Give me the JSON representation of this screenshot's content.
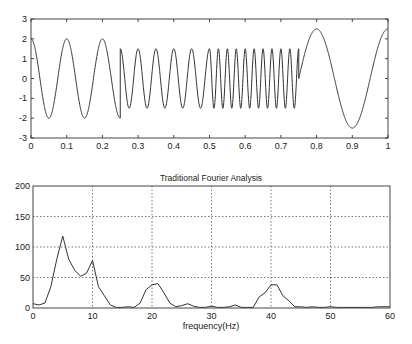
{
  "chart_data": [
    {
      "type": "line",
      "title": "",
      "xlabel": "",
      "ylabel": "",
      "xlim": [
        0,
        1
      ],
      "ylim": [
        -3,
        3
      ],
      "grid": false,
      "x_ticks": [
        "0",
        "0.1",
        "0.2",
        "0.3",
        "0.4",
        "0.5",
        "0.6",
        "0.7",
        "0.8",
        "0.9",
        "1"
      ],
      "y_ticks": [
        "3",
        "2",
        "1",
        "0",
        "-1",
        "-2",
        "-3"
      ],
      "segments": [
        {
          "t_start": 0.0,
          "t_end": 0.25,
          "frequency_hz": 10,
          "amplitude": 2.0,
          "form": "cos"
        },
        {
          "t_start": 0.25,
          "t_end": 0.5,
          "frequency_hz": 20,
          "amplitude": 1.5,
          "form": "cos"
        },
        {
          "t_start": 0.5,
          "t_end": 0.75,
          "frequency_hz": 40,
          "amplitude": 1.5,
          "form": "cos"
        },
        {
          "t_start": 0.75,
          "t_end": 1.0,
          "frequency_hz": 5,
          "amplitude": 2.5,
          "form": "sin"
        }
      ]
    },
    {
      "type": "line",
      "title": "Traditional Fourier Analysis",
      "xlabel": "frequency(Hz)",
      "ylabel": "",
      "xlim": [
        0,
        60
      ],
      "ylim": [
        0,
        200
      ],
      "grid": true,
      "x_ticks": [
        "0",
        "10",
        "20",
        "30",
        "40",
        "50",
        "60"
      ],
      "y_ticks": [
        "200",
        "150",
        "100",
        "50",
        "0"
      ],
      "x": [
        0,
        1,
        2,
        3,
        4,
        5,
        6,
        7,
        8,
        9,
        10,
        11,
        12,
        13,
        14,
        15,
        16,
        17,
        18,
        19,
        20,
        21,
        22,
        23,
        24,
        25,
        26,
        27,
        28,
        29,
        30,
        31,
        32,
        33,
        34,
        35,
        36,
        37,
        38,
        39,
        40,
        41,
        42,
        43,
        44,
        45,
        46,
        47,
        48,
        49,
        50,
        51,
        52,
        53,
        54,
        55,
        56,
        57,
        58,
        59,
        60
      ],
      "values": [
        7,
        5,
        8,
        35,
        80,
        118,
        80,
        62,
        52,
        57,
        78,
        35,
        20,
        5,
        1,
        1,
        2,
        1,
        8,
        30,
        38,
        40,
        25,
        8,
        2,
        4,
        7,
        3,
        1,
        1,
        3,
        1,
        1,
        2,
        5,
        1,
        1,
        1,
        18,
        25,
        38,
        38,
        20,
        12,
        2,
        2,
        1,
        2,
        1,
        1,
        2,
        1,
        1,
        1,
        1,
        1,
        1,
        1,
        2,
        2,
        2
      ]
    }
  ]
}
